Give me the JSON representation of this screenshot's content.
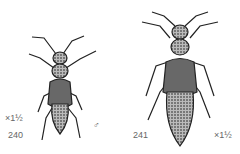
{
  "figures": [
    {
      "number": "240",
      "magnification": "×1½",
      "sex_symbol": "♂"
    },
    {
      "number": "241",
      "magnification": "×1½"
    }
  ]
}
